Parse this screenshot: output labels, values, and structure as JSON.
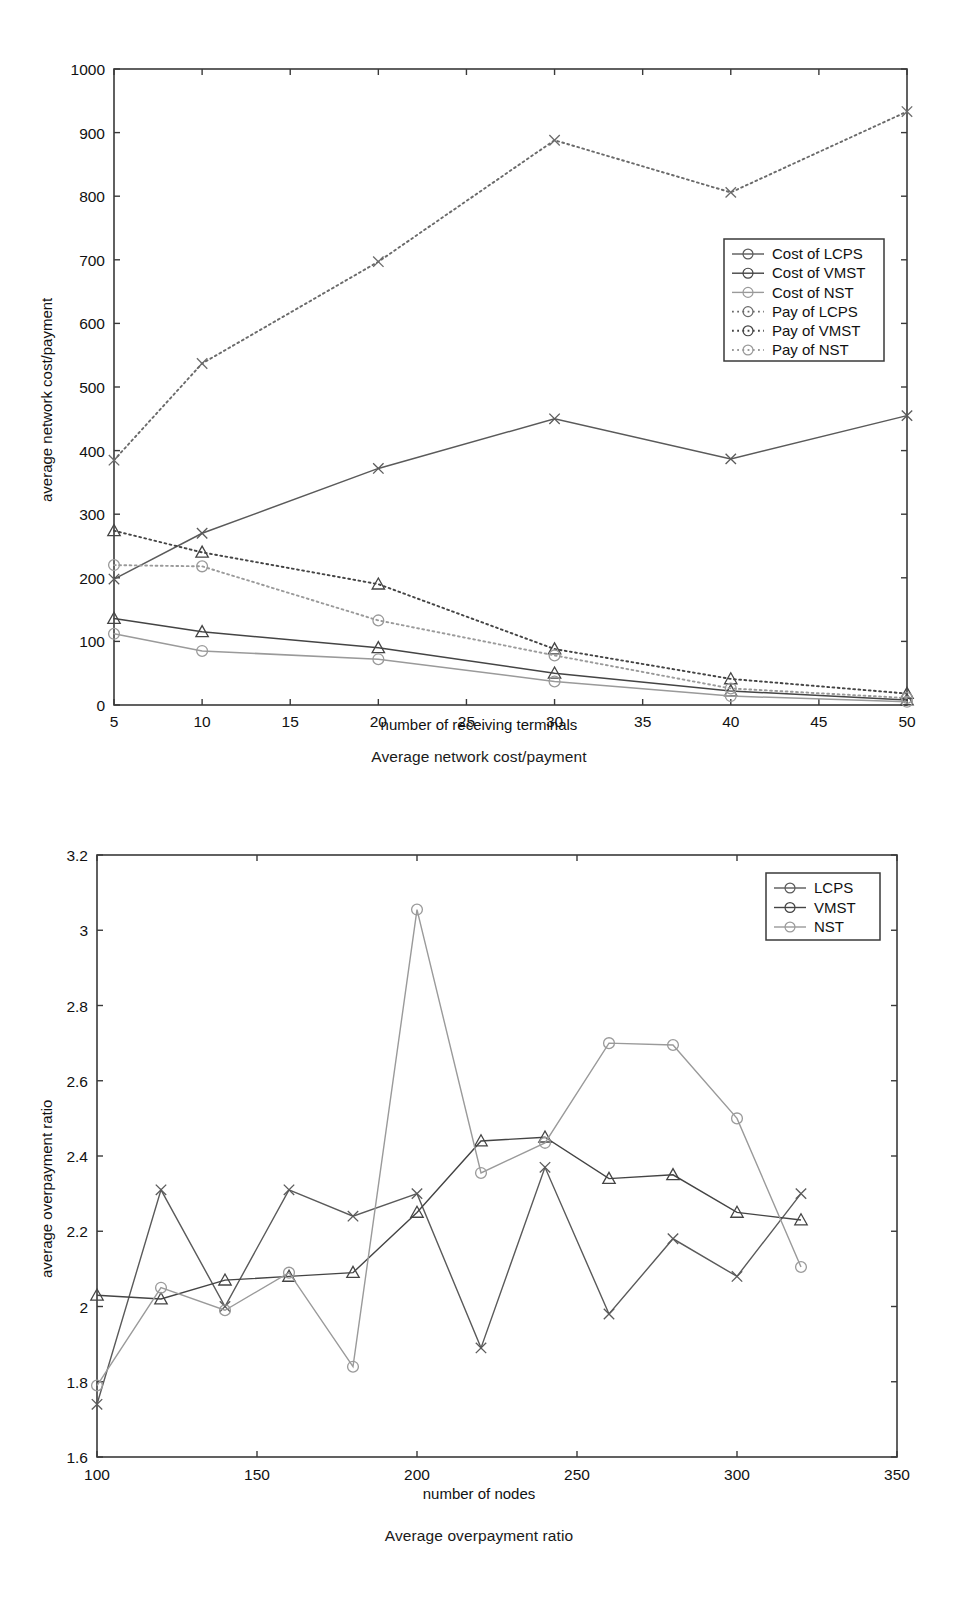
{
  "figure1": {
    "caption": "Average network cost/payment",
    "legend": {
      "entries": [
        {
          "label": "Cost of LCPS",
          "marker": "x-marker",
          "style": "solid",
          "color": "#5a5a5a"
        },
        {
          "label": "Cost of VMST",
          "marker": "triangle-marker",
          "style": "solid",
          "color": "#444444"
        },
        {
          "label": "Cost of NST",
          "marker": "circle-marker",
          "style": "solid",
          "color": "#9a9a9a"
        },
        {
          "label": "Pay of LCPS",
          "marker": "x-marker",
          "style": "dotted",
          "color": "#6a6a6a"
        },
        {
          "label": "Pay of VMST",
          "marker": "triangle-marker",
          "style": "dotted",
          "color": "#444444"
        },
        {
          "label": "Pay of NST",
          "marker": "circle-marker",
          "style": "dotted",
          "color": "#9a9a9a"
        }
      ]
    }
  },
  "figure2": {
    "caption": "Average overpayment ratio",
    "legend": {
      "entries": [
        {
          "label": "LCPS",
          "marker": "x-marker",
          "style": "solid",
          "color": "#5a5a5a"
        },
        {
          "label": "VMST",
          "marker": "triangle-marker",
          "style": "solid",
          "color": "#444444"
        },
        {
          "label": "NST",
          "marker": "circle-marker",
          "style": "solid",
          "color": "#9a9a9a"
        }
      ]
    }
  },
  "chart_data": [
    {
      "type": "line",
      "title": "Average network cost/payment",
      "xlabel": "number of receiving terminals",
      "ylabel": "average network cost/payment",
      "x": [
        5,
        10,
        20,
        30,
        40,
        50
      ],
      "xlim": [
        5,
        50
      ],
      "ylim": [
        0,
        1000
      ],
      "xticks": [
        5,
        10,
        15,
        20,
        25,
        30,
        35,
        40,
        45,
        50
      ],
      "yticks": [
        0,
        100,
        200,
        300,
        400,
        500,
        600,
        700,
        800,
        900,
        1000
      ],
      "grid": false,
      "legend_position": "center-right",
      "series": [
        {
          "name": "Cost of LCPS",
          "marker": "x",
          "linestyle": "solid",
          "color": "#5a5a5a",
          "values": [
            198,
            270,
            372,
            450,
            387,
            455
          ]
        },
        {
          "name": "Cost of VMST",
          "marker": "triangle",
          "linestyle": "solid",
          "color": "#444444",
          "values": [
            136,
            115,
            90,
            50,
            22,
            8
          ]
        },
        {
          "name": "Cost of NST",
          "marker": "circle",
          "linestyle": "solid",
          "color": "#9a9a9a",
          "values": [
            112,
            85,
            72,
            37,
            14,
            5
          ]
        },
        {
          "name": "Pay of LCPS",
          "marker": "x",
          "linestyle": "dotted",
          "color": "#6a6a6a",
          "values": [
            385,
            537,
            697,
            888,
            806,
            933
          ]
        },
        {
          "name": "Pay of VMST",
          "marker": "triangle",
          "linestyle": "dotted",
          "color": "#444444",
          "values": [
            274,
            240,
            190,
            88,
            41,
            18
          ]
        },
        {
          "name": "Pay of NST",
          "marker": "circle",
          "linestyle": "dotted",
          "color": "#9a9a9a",
          "values": [
            220,
            218,
            133,
            78,
            26,
            11
          ]
        }
      ]
    },
    {
      "type": "line",
      "title": "Average overpayment ratio",
      "xlabel": "number of nodes",
      "ylabel": "average overpayment ratio",
      "x": [
        100,
        120,
        140,
        160,
        180,
        200,
        220,
        240,
        260,
        280,
        300,
        320
      ],
      "xlim": [
        100,
        350
      ],
      "ylim": [
        1.6,
        3.2
      ],
      "xticks": [
        100,
        150,
        200,
        250,
        300,
        350
      ],
      "yticks": [
        1.6,
        1.8,
        2.0,
        2.2,
        2.4,
        2.6,
        2.8,
        3.0,
        3.2
      ],
      "ytick_labels": [
        "1.6",
        "1.8",
        "2",
        "2.2",
        "2.4",
        "2.6",
        "2.8",
        "3",
        "3.2"
      ],
      "grid": false,
      "legend_position": "top-right",
      "series": [
        {
          "name": "LCPS",
          "marker": "x",
          "linestyle": "solid",
          "color": "#5a5a5a",
          "values": [
            1.74,
            2.31,
            2.0,
            2.31,
            2.24,
            2.3,
            1.89,
            2.37,
            1.98,
            2.18,
            2.08,
            2.3
          ]
        },
        {
          "name": "VMST",
          "marker": "triangle",
          "linestyle": "solid",
          "color": "#444444",
          "values": [
            2.03,
            2.02,
            2.07,
            2.08,
            2.09,
            2.25,
            2.44,
            2.45,
            2.34,
            2.35,
            2.25,
            2.23
          ]
        },
        {
          "name": "NST",
          "marker": "circle",
          "linestyle": "solid",
          "color": "#9a9a9a",
          "values": [
            1.79,
            2.05,
            1.99,
            2.09,
            1.84,
            3.055,
            2.355,
            2.435,
            2.7,
            2.695,
            2.5,
            2.105
          ]
        }
      ]
    }
  ]
}
